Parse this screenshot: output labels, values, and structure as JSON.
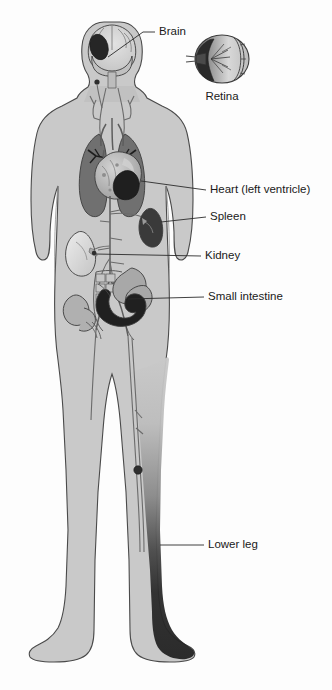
{
  "figure": {
    "background_color": "#fdfdfd"
  },
  "colors": {
    "body_fill": "#c9c9c9",
    "body_outline": "#4a4a4a",
    "organ_light": "#d8d8d8",
    "organ_mid": "#a0a0a0",
    "organ_dark": "#6e6e6e",
    "infarct_dark": "#262626",
    "lung": "#707070",
    "vessel": "#5d5d5d",
    "label_text": "#1a1a1a",
    "leader_line": "#2b2b2b"
  },
  "labels": [
    {
      "id": "brain",
      "text": "Brain",
      "text_x": 159,
      "text_y": 32,
      "leader": "M 155 32 L 143 32 L 108 57",
      "anchor": "start"
    },
    {
      "id": "retina",
      "text": "Retina",
      "text_x": 222,
      "text_y": 97,
      "leader": "",
      "anchor": "middle"
    },
    {
      "id": "heart-left-ventricle",
      "text": "Heart (left ventricle)",
      "text_x": 210,
      "text_y": 190,
      "leader": "M 206 190 L 141 181",
      "anchor": "start"
    },
    {
      "id": "spleen",
      "text": "Spleen",
      "text_x": 210,
      "text_y": 217,
      "leader": "M 206 217 L 161 222",
      "anchor": "start"
    },
    {
      "id": "kidney",
      "text": "Kidney",
      "text_x": 205,
      "text_y": 256,
      "leader": "M 201 256 L 95 254",
      "anchor": "start"
    },
    {
      "id": "small-intestine",
      "text": "Small intestine",
      "text_x": 208,
      "text_y": 297,
      "leader": "M 204 297 L 128 299",
      "anchor": "start"
    },
    {
      "id": "lower-leg",
      "text": "Lower leg",
      "text_x": 208,
      "text_y": 545,
      "leader": "M 204 545 L 160 545",
      "anchor": "start"
    }
  ],
  "organs": [
    {
      "id": "brain",
      "name": "Brain",
      "shade": "#d8d8d8",
      "has_infarct": true,
      "infarct_shade": "#262626"
    },
    {
      "id": "eye",
      "name": "Eye with retina",
      "shade": "#d0d0d0",
      "has_infarct": true,
      "infarct_shade": "#2a2a2a"
    },
    {
      "id": "lung-left",
      "name": "Left lung",
      "shade": "#707070",
      "has_infarct": false
    },
    {
      "id": "lung-right",
      "name": "Right lung",
      "shade": "#707070",
      "has_infarct": false
    },
    {
      "id": "heart",
      "name": "Heart",
      "shade": "#b5b5b5",
      "has_infarct": true,
      "infarct_shade": "#1f1f1f"
    },
    {
      "id": "spleen",
      "name": "Spleen",
      "shade": "#3a3a3a",
      "has_infarct": true,
      "infarct_shade": "#262626"
    },
    {
      "id": "kidney",
      "name": "Kidney",
      "shade": "#dcdcdc",
      "has_infarct": false
    },
    {
      "id": "small-intestine",
      "name": "Small intestine",
      "shade": "#202020",
      "has_infarct": true,
      "infarct_shade": "#1a1a1a"
    },
    {
      "id": "colon",
      "name": "Colon",
      "shade": "#a8a8a8",
      "has_infarct": false
    },
    {
      "id": "lower-leg",
      "name": "Lower leg",
      "shade": "#232323",
      "has_infarct": true,
      "infarct_shade": "#1c1c1c"
    }
  ]
}
